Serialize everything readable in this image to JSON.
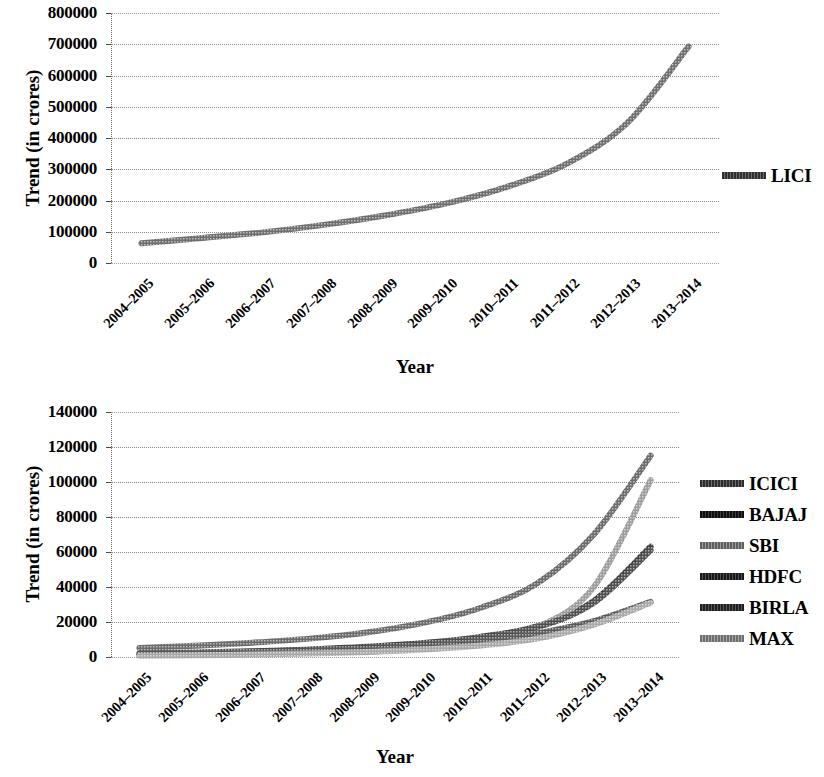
{
  "chart_data": [
    {
      "id": "upper",
      "type": "line",
      "title": "",
      "xlabel": "Year",
      "ylabel": "Trend (in crores)",
      "categories": [
        "2004–2005",
        "2005–2006",
        "2006–2007",
        "2007–2008",
        "2008–2009",
        "2009–2010",
        "2010–2011",
        "2011–2012",
        "2012–2013",
        "2013–2014"
      ],
      "ylim": [
        0,
        800000
      ],
      "yticks": [
        0,
        100000,
        200000,
        300000,
        400000,
        500000,
        600000,
        700000,
        800000
      ],
      "ytick_labels": [
        "0",
        "100000",
        "200000",
        "300000",
        "400000",
        "500000",
        "600000",
        "700000",
        "800000"
      ],
      "grid": true,
      "legend_position": "right",
      "series": [
        {
          "name": "LICI",
          "color": "#6e6e6e",
          "values": [
            63000,
            80000,
            98000,
            122000,
            152000,
            190000,
            243000,
            318000,
            450000,
            693000
          ]
        }
      ]
    },
    {
      "id": "lower",
      "type": "line",
      "title": "",
      "xlabel": "Year",
      "ylabel": "Trend (in crores)",
      "categories": [
        "2004–2005",
        "2005–2006",
        "2006–2007",
        "2007–2008",
        "2008–2009",
        "2009–2010",
        "2010–2011",
        "2011–2012",
        "2012–2013",
        "2013–2014"
      ],
      "ylim": [
        0,
        140000
      ],
      "yticks": [
        0,
        20000,
        40000,
        60000,
        80000,
        100000,
        120000,
        140000
      ],
      "ytick_labels": [
        "0",
        "20000",
        "40000",
        "60000",
        "80000",
        "100000",
        "120000",
        "140000"
      ],
      "grid": true,
      "legend_position": "right",
      "series": [
        {
          "name": "ICICI",
          "color": "#6b6b6b",
          "values": [
            5200,
            6500,
            8200,
            10500,
            14000,
            19500,
            28000,
            42000,
            70000,
            115000
          ]
        },
        {
          "name": "BAJAJ",
          "color": "#3d3d3d",
          "values": [
            2000,
            2600,
            3300,
            4300,
            5800,
            8000,
            11500,
            17500,
            32000,
            63000
          ]
        },
        {
          "name": "SBI",
          "color": "#9c9c9c",
          "values": [
            1200,
            1600,
            2100,
            2900,
            4200,
            6200,
            9800,
            17000,
            40000,
            101000
          ]
        },
        {
          "name": "HDFC",
          "color": "#4f4f4f",
          "values": [
            1800,
            2300,
            3000,
            4000,
            5400,
            7600,
            11000,
            17000,
            31000,
            61000
          ]
        },
        {
          "name": "BIRLA",
          "color": "#595959",
          "values": [
            1500,
            1900,
            2500,
            3300,
            4500,
            6300,
            9000,
            13500,
            20500,
            31500
          ]
        },
        {
          "name": "MAX",
          "color": "#a8a8a8",
          "values": [
            700,
            1000,
            1400,
            2000,
            2900,
            4300,
            6600,
            10500,
            18500,
            31000
          ]
        }
      ]
    }
  ],
  "upper": {
    "ylabel": "Trend (in crores)",
    "xlabel": "Year",
    "ytick_labels": [
      "800000",
      "700000",
      "600000",
      "500000",
      "400000",
      "300000",
      "200000",
      "100000",
      "0"
    ],
    "xtick_labels": [
      "2004–2005",
      "2005–2006",
      "2006–2007",
      "2007–2008",
      "2008–2009",
      "2009–2010",
      "2010–2011",
      "2011–2012",
      "2012–2013",
      "2013–2014"
    ],
    "legend": [
      {
        "label": "LICI",
        "color": "#6e6e6e"
      }
    ]
  },
  "lower": {
    "ylabel": "Trend (in crores)",
    "xlabel": "Year",
    "ytick_labels": [
      "140000",
      "120000",
      "100000",
      "80000",
      "60000",
      "40000",
      "20000",
      "0"
    ],
    "xtick_labels": [
      "2004–2005",
      "2005–2006",
      "2006–2007",
      "2007–2008",
      "2008–2009",
      "2009–2010",
      "2010–2011",
      "2011–2012",
      "2012–2013",
      "2013–2014"
    ],
    "legend": [
      {
        "label": "ICICI",
        "color": "#6b6b6b"
      },
      {
        "label": "BAJAJ",
        "color": "#3d3d3d"
      },
      {
        "label": "SBI",
        "color": "#9c9c9c"
      },
      {
        "label": "HDFC",
        "color": "#4f4f4f"
      },
      {
        "label": "BIRLA",
        "color": "#595959"
      },
      {
        "label": "MAX",
        "color": "#a8a8a8"
      }
    ]
  }
}
